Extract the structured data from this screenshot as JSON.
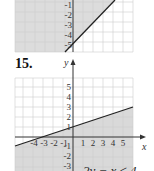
{
  "top_graph": {
    "y_tick_labels": [
      "-1",
      "-2",
      "-3",
      "-4",
      "-5"
    ],
    "boundary_line": "solid",
    "shaded_side": "above-left"
  },
  "problem": {
    "number": "15.",
    "axis_x_label": "x",
    "axis_y_label": "y",
    "y_tick_labels_positive": [
      "5",
      "4",
      "3",
      "2",
      "1"
    ],
    "y_tick_labels_negative": [
      "-1",
      "-2",
      "-3"
    ],
    "x_tick_labels_negative": [
      "-4",
      "-3",
      "-2",
      "-1"
    ],
    "x_tick_labels_positive": [
      "1",
      "2",
      "3",
      "4",
      "5"
    ],
    "boundary_line": "solid",
    "boundary_points": [
      [
        -4,
        0
      ],
      [
        0,
        2
      ]
    ],
    "shaded_side": "below",
    "bottom_caption_fragment": "2y − x ≤ 4"
  },
  "colors": {
    "grid": "#d2d2d2",
    "shade": "#d9d9d9",
    "axis": "#333333",
    "line": "#222222"
  }
}
